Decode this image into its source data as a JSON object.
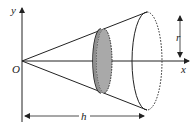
{
  "diagram": {
    "type": "cone-volume-by-disc",
    "labels": {
      "y_axis": "y",
      "x_axis": "x",
      "origin": "O",
      "radius": "r",
      "height": "h"
    },
    "colors": {
      "stroke": "#222222",
      "disc_fill": "#a9a9a9",
      "background": "#ffffff"
    }
  }
}
